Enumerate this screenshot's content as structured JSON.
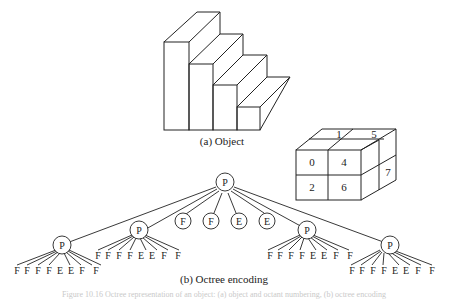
{
  "figure": {
    "object_caption": "(a) Object",
    "encoding_caption": "(b) Octree encoding",
    "figure_caption": "Figure 10.16  Octree representation of an object: (a) object and octant numbering, (b) octree encoding",
    "octant_labels": {
      "front": [
        "0",
        "4",
        "2",
        "6"
      ],
      "top": [
        "1",
        "5"
      ],
      "side": [
        "7"
      ]
    },
    "tree": {
      "root": "P",
      "children": [
        {
          "label": "P",
          "leaves": [
            "F",
            "F",
            "F",
            "F",
            "E",
            "E",
            "F",
            "F"
          ]
        },
        {
          "label": "P",
          "leaves": [
            "F",
            "F",
            "F",
            "F",
            "E",
            "E",
            "F",
            "F"
          ]
        },
        {
          "label": "F"
        },
        {
          "label": "F"
        },
        {
          "label": "E"
        },
        {
          "label": "E"
        },
        {
          "label": "P",
          "leaves": [
            "F",
            "F",
            "F",
            "F",
            "E",
            "E",
            "F",
            "F"
          ]
        },
        {
          "label": "P",
          "leaves": [
            "F",
            "F",
            "F",
            "F",
            "E",
            "E",
            "F",
            "F"
          ]
        }
      ]
    }
  }
}
